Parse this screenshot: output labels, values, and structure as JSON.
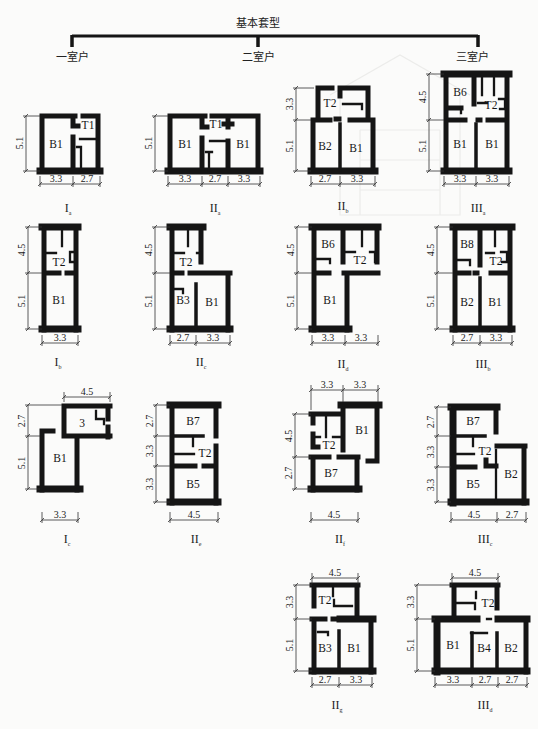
{
  "title": "基本套型",
  "categories": [
    {
      "label": "一室户"
    },
    {
      "label": "二室户"
    },
    {
      "label": "三室户"
    }
  ],
  "plans": [
    {
      "type": "I",
      "sub": "a",
      "rooms": [
        "B1",
        "T1"
      ],
      "dims_v": [
        "5.1"
      ],
      "dims_h": [
        "3.3",
        "2.7"
      ]
    },
    {
      "type": "II",
      "sub": "a",
      "rooms": [
        "B1",
        "T1",
        "B1"
      ],
      "dims_v": [
        "5.1"
      ],
      "dims_h": [
        "3.3",
        "2.7",
        "3.3"
      ]
    },
    {
      "type": "II",
      "sub": "b",
      "rooms": [
        "T2",
        "B2",
        "B1"
      ],
      "dims_v": [
        "3.3",
        "5.1"
      ],
      "dims_h": [
        "2.7",
        "3.3"
      ]
    },
    {
      "type": "III",
      "sub": "a",
      "rooms": [
        "B6",
        "T2",
        "B1",
        "B1"
      ],
      "dims_v": [
        "4.5",
        "5.1"
      ],
      "dims_h": [
        "3.3",
        "3.3"
      ]
    },
    {
      "type": "I",
      "sub": "b",
      "rooms": [
        "T2",
        "B1"
      ],
      "dims_v": [
        "4.5",
        "5.1"
      ],
      "dims_h": [
        "3.3"
      ]
    },
    {
      "type": "II",
      "sub": "c",
      "rooms": [
        "T2",
        "B3",
        "B1"
      ],
      "dims_v": [
        "4.5",
        "5.1"
      ],
      "dims_h": [
        "2.7",
        "3.3"
      ]
    },
    {
      "type": "II",
      "sub": "d",
      "rooms": [
        "B6",
        "T2",
        "B1"
      ],
      "dims_v": [
        "4.5",
        "5.1"
      ],
      "dims_h": [
        "3.3",
        "3.3"
      ]
    },
    {
      "type": "III",
      "sub": "b",
      "rooms": [
        "B8",
        "T2",
        "B2",
        "B1"
      ],
      "dims_v": [
        "4.5",
        "5.1"
      ],
      "dims_h": [
        "2.7",
        "3.3"
      ]
    },
    {
      "type": "I",
      "sub": "c",
      "rooms": [
        "3",
        "B1"
      ],
      "dims_v": [
        "2.7",
        "5.1"
      ],
      "dims_h": [
        "3.3"
      ],
      "dims_top": [
        "4.5"
      ]
    },
    {
      "type": "II",
      "sub": "e",
      "rooms": [
        "B7",
        "T2",
        "B5"
      ],
      "dims_v": [
        "2.7",
        "3.3",
        "3.3"
      ],
      "dims_h": [
        "4.5"
      ]
    },
    {
      "type": "II",
      "sub": "f",
      "rooms": [
        "B1",
        "T2",
        "B7"
      ],
      "dims_v": [
        "4.5",
        "2.7"
      ],
      "dims_h": [
        "4.5"
      ],
      "dims_top": [
        "3.3",
        "3.3"
      ]
    },
    {
      "type": "III",
      "sub": "c",
      "rooms": [
        "B7",
        "T2",
        "B5",
        "B2"
      ],
      "dims_v": [
        "2.7",
        "3.3",
        "3.3"
      ],
      "dims_h": [
        "4.5",
        "2.7"
      ]
    },
    {
      "type": "II",
      "sub": "g",
      "rooms": [
        "T2",
        "B3",
        "B1"
      ],
      "dims_v": [
        "3.3",
        "5.1"
      ],
      "dims_h": [
        "2.7",
        "3.3"
      ],
      "dims_top": [
        "4.5"
      ]
    },
    {
      "type": "III",
      "sub": "d",
      "rooms": [
        "T2",
        "B1",
        "B4",
        "B2"
      ],
      "dims_v": [
        "3.3",
        "5.1"
      ],
      "dims_h": [
        "3.3",
        "2.7",
        "2.7"
      ],
      "dims_top": [
        "4.5"
      ]
    }
  ]
}
